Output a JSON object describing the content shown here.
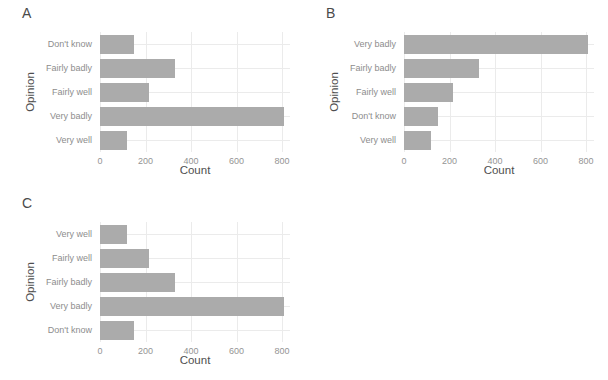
{
  "figure": {
    "width": 608,
    "height": 380,
    "background": "#ffffff",
    "bar_color": "#ababab",
    "grid_color": "#ebebeb",
    "tick_text_color": "#949494",
    "category_text_color": "#8d8d8d",
    "axis_title_color": "#4f4f4f",
    "panel_letter_color": "#4a4a4a"
  },
  "chart_data": [
    {
      "type": "bar",
      "orientation": "horizontal",
      "panel_label": "A",
      "title": "",
      "xlabel": "Count",
      "ylabel": "Opinion",
      "categories": [
        "Don't know",
        "Fairly badly",
        "Fairly well",
        "Very badly",
        "Very well"
      ],
      "values": [
        150,
        330,
        215,
        810,
        120
      ],
      "xlim": [
        0,
        835
      ],
      "xticks": [
        0,
        200,
        400,
        600,
        800
      ],
      "grid": true,
      "legend": false
    },
    {
      "type": "bar",
      "orientation": "horizontal",
      "panel_label": "B",
      "title": "",
      "xlabel": "Count",
      "ylabel": "Opinion",
      "categories": [
        "Very badly",
        "Fairly badly",
        "Fairly well",
        "Don't know",
        "Very well"
      ],
      "values": [
        810,
        330,
        215,
        150,
        120
      ],
      "xlim": [
        0,
        835
      ],
      "xticks": [
        0,
        200,
        400,
        600,
        800
      ],
      "grid": true,
      "legend": false
    },
    {
      "type": "bar",
      "orientation": "horizontal",
      "panel_label": "C",
      "title": "",
      "xlabel": "Count",
      "ylabel": "Opinion",
      "categories": [
        "Very well",
        "Fairly well",
        "Fairly badly",
        "Very badly",
        "Don't know"
      ],
      "values": [
        120,
        215,
        330,
        810,
        150
      ],
      "xlim": [
        0,
        835
      ],
      "xticks": [
        0,
        200,
        400,
        600,
        800
      ],
      "grid": true,
      "legend": false
    }
  ]
}
